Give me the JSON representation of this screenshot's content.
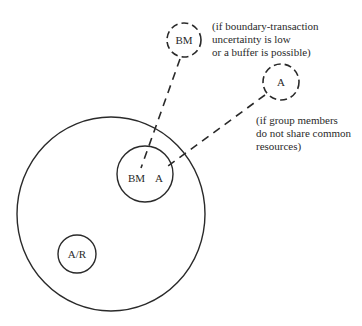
{
  "diagram": {
    "nodes": {
      "bm_outside": {
        "label": "BM",
        "style": "dashed"
      },
      "a_outside": {
        "label": "A",
        "style": "dashed"
      },
      "inner_bm": {
        "label": "BM"
      },
      "inner_a": {
        "label": "A"
      },
      "ar": {
        "label": "A/R"
      }
    },
    "notes": {
      "bm_note": [
        "(if boundary-transaction",
        "uncertainty is low",
        "or a buffer is possible)"
      ],
      "a_note": [
        "(if group members",
        "do not share common",
        "resources)"
      ]
    },
    "colors": {
      "stroke": "#2a2a2a",
      "background": "#ffffff"
    }
  }
}
